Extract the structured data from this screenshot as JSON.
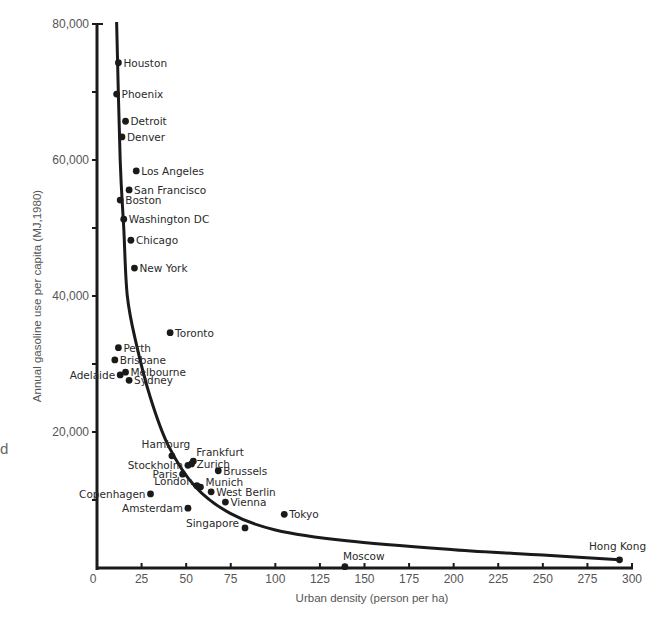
{
  "edge_fragment": "d",
  "chart_data": {
    "type": "scatter",
    "title": "",
    "xlabel": "Urban density (person per ha)",
    "ylabel": "Annual gasoline use per capita (MJ,1980)",
    "xlim": [
      0,
      300
    ],
    "ylim": [
      0,
      80000
    ],
    "x_ticks": [
      0,
      25,
      50,
      75,
      100,
      125,
      150,
      175,
      200,
      225,
      250,
      275,
      300
    ],
    "x_tick_labels": [
      "0",
      "25",
      "50",
      "75",
      "100",
      "125",
      "150",
      "175",
      "200",
      "225",
      "250",
      "275",
      "300"
    ],
    "y_ticks": [
      20000,
      40000,
      60000,
      80000
    ],
    "y_tick_labels": [
      "20,000",
      "40,000",
      "60,000",
      "80,000"
    ],
    "y_minor_ticks": [
      10000,
      30000,
      50000,
      70000
    ],
    "grid": false,
    "legend": null,
    "trend_curve": {
      "description": "hyperbolic fit line",
      "points": [
        [
          11,
          80000
        ],
        [
          13,
          60000
        ],
        [
          15,
          50000
        ],
        [
          17,
          40000
        ],
        [
          22,
          33000
        ],
        [
          30,
          25000
        ],
        [
          40,
          18000
        ],
        [
          55,
          12000
        ],
        [
          75,
          8000
        ],
        [
          100,
          5600
        ],
        [
          140,
          4000
        ],
        [
          200,
          2700
        ],
        [
          250,
          1900
        ],
        [
          293,
          1200
        ]
      ]
    },
    "points": [
      {
        "label": "Houston",
        "x": 12,
        "y": 74300,
        "label_side": "right"
      },
      {
        "label": "Phoenix",
        "x": 11,
        "y": 69700,
        "label_side": "right"
      },
      {
        "label": "Detroit",
        "x": 16,
        "y": 65700,
        "label_side": "right"
      },
      {
        "label": "Denver",
        "x": 14,
        "y": 63400,
        "label_side": "right"
      },
      {
        "label": "Los Angeles",
        "x": 22,
        "y": 58400,
        "label_side": "right"
      },
      {
        "label": "San Francisco",
        "x": 18,
        "y": 55600,
        "label_side": "right"
      },
      {
        "label": "Boston",
        "x": 13,
        "y": 54100,
        "label_side": "right"
      },
      {
        "label": "Washington DC",
        "x": 15,
        "y": 51300,
        "label_side": "right"
      },
      {
        "label": "Chicago",
        "x": 19,
        "y": 48200,
        "label_side": "right"
      },
      {
        "label": "New York",
        "x": 21,
        "y": 44100,
        "label_side": "right"
      },
      {
        "label": "Toronto",
        "x": 41,
        "y": 34600,
        "label_side": "right"
      },
      {
        "label": "Perth",
        "x": 12,
        "y": 32400,
        "label_side": "right"
      },
      {
        "label": "Brisbane",
        "x": 10,
        "y": 30600,
        "label_side": "right"
      },
      {
        "label": "Melbourne",
        "x": 16,
        "y": 28800,
        "label_side": "right"
      },
      {
        "label": "Adelaide",
        "x": 13,
        "y": 28400,
        "label_side": "left"
      },
      {
        "label": "Sydney",
        "x": 18,
        "y": 27600,
        "label_side": "right"
      },
      {
        "label": "Hamburg",
        "x": 42,
        "y": 16500,
        "label_side": "above"
      },
      {
        "label": "Frankfurt",
        "x": 54,
        "y": 15700,
        "label_side": "above-right"
      },
      {
        "label": "Zurich",
        "x": 53,
        "y": 15300,
        "label_side": "right"
      },
      {
        "label": "Stockholm",
        "x": 51,
        "y": 15100,
        "label_side": "left"
      },
      {
        "label": "Brussels",
        "x": 68,
        "y": 14300,
        "label_side": "right"
      },
      {
        "label": "Paris",
        "x": 48,
        "y": 13800,
        "label_side": "left"
      },
      {
        "label": "London",
        "x": 56,
        "y": 12100,
        "label_side": "left"
      },
      {
        "label": "Munich",
        "x": 58,
        "y": 11900,
        "label_side": "above-right"
      },
      {
        "label": "Copenhagen",
        "x": 30,
        "y": 10900,
        "label_side": "left"
      },
      {
        "label": "West Berlin",
        "x": 64,
        "y": 11200,
        "label_side": "right"
      },
      {
        "label": "Vienna",
        "x": 72,
        "y": 9700,
        "label_side": "right"
      },
      {
        "label": "Amsterdam",
        "x": 51,
        "y": 8800,
        "label_side": "left"
      },
      {
        "label": "Tokyo",
        "x": 105,
        "y": 7900,
        "label_side": "right"
      },
      {
        "label": "Singapore",
        "x": 83,
        "y": 5900,
        "label_side": "left"
      },
      {
        "label": "Moscow",
        "x": 139,
        "y": 200,
        "label_side": "above"
      },
      {
        "label": "Hong Kong",
        "x": 293,
        "y": 1200,
        "label_side": "above"
      }
    ]
  }
}
